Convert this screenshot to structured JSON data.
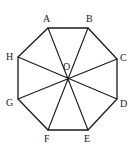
{
  "diagram": {
    "center": {
      "label": "O",
      "x": 68,
      "y": 79,
      "label_x": 63,
      "label_y": 70
    },
    "vertices": [
      {
        "label": "A",
        "x": 48,
        "y": 28,
        "label_x": 43,
        "label_y": 22
      },
      {
        "label": "B",
        "x": 88,
        "y": 28,
        "label_x": 86,
        "label_y": 22
      },
      {
        "label": "C",
        "x": 117,
        "y": 59,
        "label_x": 120,
        "label_y": 61
      },
      {
        "label": "D",
        "x": 117,
        "y": 99,
        "label_x": 120,
        "label_y": 107
      },
      {
        "label": "E",
        "x": 88,
        "y": 130,
        "label_x": 84,
        "label_y": 142
      },
      {
        "label": "F",
        "x": 48,
        "y": 130,
        "label_x": 44,
        "label_y": 142
      },
      {
        "label": "G",
        "x": 18,
        "y": 99,
        "label_x": 6,
        "label_y": 106
      },
      {
        "label": "H",
        "x": 18,
        "y": 57,
        "label_x": 6,
        "label_y": 60
      }
    ],
    "diagonals_through_center": [
      "AE",
      "BF",
      "CG",
      "DH"
    ],
    "line_color": "#1a1a1a"
  }
}
